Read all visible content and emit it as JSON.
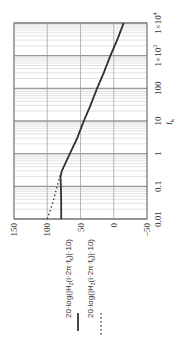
{
  "chart_data": {
    "type": "line",
    "orientation": "rotated-90-ccw",
    "title": "",
    "xlabel": "f_k",
    "ylabel": "",
    "x_scale": "log",
    "xlim": [
      0.01,
      10000
    ],
    "ylim": [
      -50,
      150
    ],
    "x_ticks": [
      "0.01",
      "0.1",
      "1",
      "10",
      "100",
      "1×10^3",
      "1×10^4"
    ],
    "y_ticks": [
      "150",
      "100",
      "50",
      "0",
      "−50"
    ],
    "grid": true,
    "x": [
      0.01,
      0.03,
      0.1,
      0.2,
      0.3,
      1,
      3,
      10,
      30,
      100,
      300,
      1000,
      3000,
      10000
    ],
    "series": [
      {
        "name": "20·log(|H2(i·2π·fk)|·10)",
        "style": "solid",
        "values": [
          79,
          79,
          79.5,
          80,
          78,
          66,
          55,
          45,
          35,
          25,
          15,
          5,
          -5,
          -15
        ]
      },
      {
        "name": "20·log(|H3(i·2π·fk)|·10)",
        "style": "dotted",
        "values": [
          100,
          92,
          85,
          81,
          78,
          66,
          55,
          45,
          35,
          25,
          15,
          5,
          -5,
          -15
        ]
      }
    ],
    "legend": {
      "position": "below-rotated",
      "entries": [
        {
          "label_prefix": "20·log",
          "label_func": "H",
          "subscript": "2",
          "label_arg": "i·2π·f",
          "arg_sub": "k",
          "label_suffix": "·10",
          "style": "solid"
        },
        {
          "label_prefix": "20·log",
          "label_func": "H",
          "subscript": "3",
          "label_arg": "i·2π·f",
          "arg_sub": "k",
          "label_suffix": "·10",
          "style": "dotted"
        }
      ]
    }
  },
  "axis_label": {
    "main": "f",
    "sub": "k"
  },
  "colors": {
    "grid_major": "#999999",
    "grid_minor": "#d0d0d0",
    "curve": "#333333",
    "frame": "#777777"
  }
}
